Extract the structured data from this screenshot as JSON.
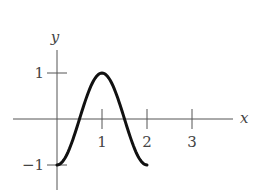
{
  "chart_data": {
    "type": "line",
    "title": "",
    "xlabel": "x",
    "ylabel": "y",
    "x_ticks": [
      1,
      2,
      3
    ],
    "y_ticks": [
      1,
      -1
    ],
    "x_tick_labels": [
      "1",
      "2",
      "3"
    ],
    "y_tick_labels": [
      "1",
      "−1"
    ],
    "xlim": [
      -1,
      4
    ],
    "ylim": [
      -1.5,
      1.5
    ],
    "grid": false,
    "legend": null,
    "series": [
      {
        "name": "y = -cos(πx)",
        "x": [
          0,
          0.25,
          0.5,
          0.75,
          1,
          1.25,
          1.5,
          1.75,
          2
        ],
        "values": [
          -1,
          -0.71,
          0,
          0.71,
          1,
          0.71,
          0,
          -0.71,
          -1
        ]
      }
    ]
  },
  "layout": {
    "origin_px": [
      57,
      119
    ],
    "unit_x_px": 45,
    "unit_y_px": 46,
    "x_axis_range_px": [
      13,
      233
    ],
    "y_axis_range_px": [
      50,
      190
    ]
  }
}
